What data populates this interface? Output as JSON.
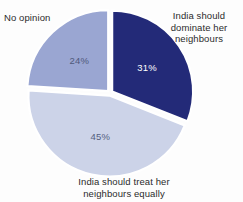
{
  "chart_data": {
    "type": "pie",
    "title": "",
    "subtitle": "",
    "xlabel": "",
    "ylabel": "",
    "legend_position": "annotations-around-pie",
    "grid": false,
    "units": "percent",
    "start_angle_deg": 0,
    "direction": "clockwise",
    "categories": [
      "India should dominate her neighbours",
      "India should treat her neighbours equally",
      "No opinion"
    ],
    "values": [
      31,
      45,
      24
    ],
    "value_labels": [
      "31%",
      "45%",
      "24%"
    ],
    "colors": [
      "#232a78",
      "#ccd3e8",
      "#9aa6d2"
    ],
    "slices": [
      {
        "label": "India should dominate her neighbours",
        "label_line1": "India should",
        "label_line2": "dominate her",
        "label_line3": "neighbours",
        "value": 31,
        "value_label": "31%",
        "color": "#232a78",
        "value_text_color": "#ffffff",
        "start_angle_deg": 0,
        "end_angle_deg": 111.6
      },
      {
        "label": "India should treat her neighbours equally",
        "label_line1": "India should treat her",
        "label_line2": "neighbours equally",
        "value": 45,
        "value_label": "45%",
        "color": "#ccd3e8",
        "value_text_color": "#555f80",
        "start_angle_deg": 111.6,
        "end_angle_deg": 273.6
      },
      {
        "label": "No opinion",
        "label_line1": "No opinion",
        "value": 24,
        "value_label": "24%",
        "color": "#9aa6d2",
        "value_text_color": "#50597a",
        "start_angle_deg": 273.6,
        "end_angle_deg": 360
      }
    ]
  },
  "annotations": {
    "dominate": "India should\ndominate her\nneighbours",
    "no_opinion": "No opinion",
    "treat_equally": "India should treat her\nneighbours equally"
  },
  "values": {
    "dominate_pct": "31%",
    "treat_pct": "45%",
    "no_opinion_pct": "24%"
  },
  "style": {
    "background": "#fdfdfd",
    "text_color": "#2b2b2b",
    "gap_color": "#ffffff"
  }
}
